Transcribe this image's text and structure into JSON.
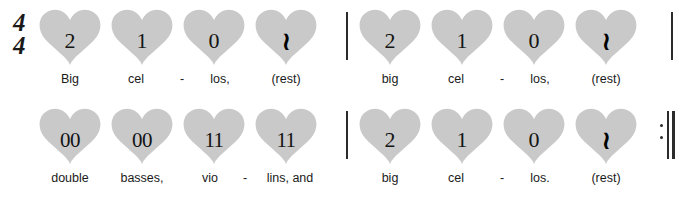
{
  "notation": {
    "time_signature": {
      "numerator": "4",
      "denominator": "4"
    },
    "heart_color": "#c9c9c9",
    "ink_color": "#1a1a1a",
    "rest_glyph": "≀",
    "hyphen": "-"
  },
  "systems": [
    {
      "id": "system-1",
      "measures": [
        {
          "id": "measure-1",
          "beats": [
            {
              "count": "2",
              "lyric": "Big",
              "is_rest": false
            },
            {
              "count": "1",
              "lyric": "cel",
              "is_rest": false
            },
            {
              "count": "0",
              "lyric": "los,",
              "is_rest": false
            },
            {
              "count": "",
              "lyric": "(rest)",
              "is_rest": true
            }
          ],
          "hyphen_after_beat": 2
        },
        {
          "id": "measure-2",
          "beats": [
            {
              "count": "2",
              "lyric": "big",
              "is_rest": false
            },
            {
              "count": "1",
              "lyric": "cel",
              "is_rest": false
            },
            {
              "count": "0",
              "lyric": "los,",
              "is_rest": false
            },
            {
              "count": "",
              "lyric": "(rest)",
              "is_rest": true
            }
          ],
          "hyphen_after_beat": 2
        }
      ],
      "end_barline": "single"
    },
    {
      "id": "system-2",
      "measures": [
        {
          "id": "measure-3",
          "beats": [
            {
              "count": "00",
              "lyric": "double",
              "is_rest": false
            },
            {
              "count": "00",
              "lyric": "basses,",
              "is_rest": false
            },
            {
              "count": "11",
              "lyric": "vio",
              "is_rest": false
            },
            {
              "count": "11",
              "lyric": "lins, and",
              "is_rest": false
            }
          ],
          "hyphen_after_beat": 3
        },
        {
          "id": "measure-4",
          "beats": [
            {
              "count": "2",
              "lyric": "big",
              "is_rest": false
            },
            {
              "count": "1",
              "lyric": "cel",
              "is_rest": false
            },
            {
              "count": "0",
              "lyric": "los.",
              "is_rest": false
            },
            {
              "count": "",
              "lyric": "(rest)",
              "is_rest": true
            }
          ],
          "hyphen_after_beat": 2
        }
      ],
      "end_barline": "repeat"
    }
  ]
}
